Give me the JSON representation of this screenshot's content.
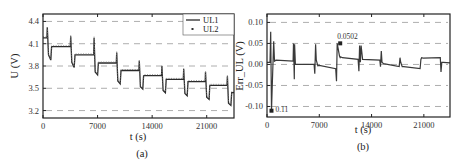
{
  "chart_data": [
    {
      "type": "line",
      "panel": "(a)",
      "xlabel": "t (s)",
      "ylabel": "U (V)",
      "xlim": [
        0,
        24500
      ],
      "ylim": [
        3.1,
        4.5
      ],
      "xticks": [
        "0",
        "7000",
        "14000",
        "21000"
      ],
      "yticks": [
        "3.2",
        "3.5",
        "3.8",
        "4.1",
        "4.4"
      ],
      "grid": "horizontal dashed",
      "legend": {
        "position": "top-right",
        "entries": [
          "UL1",
          "UL2"
        ]
      },
      "series": [
        {
          "name": "UL1",
          "style": "solid line",
          "x": [
            0,
            500,
            550,
            700,
            1000,
            1100,
            3500,
            3550,
            3700,
            4000,
            4100,
            6500,
            6550,
            6700,
            7000,
            7100,
            9400,
            9450,
            9600,
            9900,
            10000,
            12300,
            12350,
            12500,
            12800,
            12900,
            15200,
            15250,
            15400,
            15700,
            15800,
            18000,
            18050,
            18200,
            18500,
            18600,
            20800,
            20850,
            21000,
            21300,
            21400,
            23600,
            23650,
            23800,
            24100,
            24200,
            24500
          ],
          "values": [
            4.18,
            4.18,
            4.32,
            3.95,
            3.88,
            4.06,
            4.06,
            4.2,
            3.85,
            3.78,
            3.95,
            3.95,
            4.18,
            3.72,
            3.68,
            3.84,
            3.84,
            3.98,
            3.6,
            3.56,
            3.74,
            3.74,
            3.87,
            3.52,
            3.49,
            3.67,
            3.67,
            3.8,
            3.47,
            3.44,
            3.62,
            3.62,
            3.76,
            3.43,
            3.4,
            3.59,
            3.59,
            3.72,
            3.38,
            3.35,
            3.54,
            3.54,
            3.66,
            3.3,
            3.27,
            3.44,
            3.44
          ]
        },
        {
          "name": "UL2",
          "style": "dotted markers",
          "note": "closely overlaps UL1"
        }
      ]
    },
    {
      "type": "line",
      "panel": "(b)",
      "xlabel": "t (s)",
      "ylabel": "Err_UL (V)",
      "xlim": [
        0,
        24500
      ],
      "ylim": [
        -0.125,
        0.12
      ],
      "xticks": [
        "0",
        "7000",
        "14000",
        "21000"
      ],
      "yticks": [
        "0.10",
        "0.05",
        "0.00",
        "-0.05",
        "-0.10"
      ],
      "grid": "horizontal dashed",
      "annotations": [
        {
          "label": "0.0502",
          "x": 9800,
          "y": 0.0502,
          "marker": "square"
        },
        {
          "label": "0.11",
          "x": 600,
          "y": -0.11,
          "marker": "square",
          "note": "minimum, -0.11"
        }
      ],
      "series": [
        {
          "name": "Err_UL",
          "x": [
            0,
            400,
            500,
            600,
            700,
            900,
            1000,
            1200,
            3500,
            3550,
            3650,
            3700,
            3800,
            4000,
            6300,
            6400,
            6500,
            6600,
            6800,
            7000,
            9200,
            9300,
            9400,
            9700,
            9800,
            9900,
            10100,
            12200,
            12300,
            12400,
            12500,
            12600,
            12800,
            15100,
            15200,
            15300,
            15400,
            15600,
            17700,
            17800,
            17900,
            18100,
            18300,
            20500,
            20600,
            20700,
            20900,
            23200,
            23300,
            23400,
            23600,
            24500
          ],
          "values": [
            0.005,
            0.005,
            0.078,
            -0.11,
            -0.055,
            0.055,
            0.008,
            0.01,
            0.008,
            0.05,
            -0.035,
            0.048,
            0.0,
            0.0,
            0.0,
            -0.022,
            0.048,
            0.01,
            -0.003,
            -0.002,
            -0.01,
            -0.04,
            0.05,
            0.02,
            0.016,
            0.018,
            0.016,
            0.012,
            -0.016,
            0.045,
            0.005,
            0.045,
            0.012,
            0.01,
            -0.005,
            0.032,
            0.005,
            0.002,
            -0.005,
            0.016,
            0.005,
            -0.005,
            -0.005,
            -0.01,
            0.012,
            0.016,
            0.015,
            0.016,
            -0.018,
            0.005,
            0.005,
            0.004
          ]
        }
      ]
    }
  ],
  "captions": {
    "a": "(a)",
    "b": "(b)"
  },
  "legend": {
    "ul1": "UL1",
    "ul2": "UL2"
  },
  "annotations": {
    "max": "0.0502",
    "min": "0.11"
  }
}
